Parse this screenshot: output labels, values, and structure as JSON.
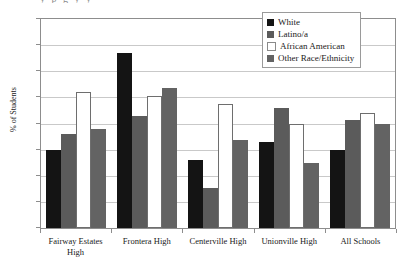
{
  "chart_data": {
    "type": "bar",
    "title": "",
    "xlabel": "",
    "ylabel": "% of Students",
    "ylim": [
      0,
      80
    ],
    "yticks": [
      0,
      10,
      20,
      30,
      40,
      50,
      60,
      70,
      80
    ],
    "grid": true,
    "legend_position": "top-right",
    "categories": [
      "Fairway Estates High",
      "Frontera High",
      "Centerville High",
      "Unionville High",
      "All Schools"
    ],
    "category_lines": [
      [
        "Fairway Estates",
        "High"
      ],
      [
        "Frontera High"
      ],
      [
        "Centerville High"
      ],
      [
        "Unionville High"
      ],
      [
        "All Schools"
      ]
    ],
    "series": [
      {
        "name": "White",
        "color": "#141414",
        "values": [
          30,
          67,
          26,
          33,
          30
        ]
      },
      {
        "name": "Latino/a",
        "color": "#5b5b5b",
        "values": [
          36,
          43,
          15.5,
          46,
          41.5
        ]
      },
      {
        "name": "African American",
        "color": "#ffffff",
        "values": [
          52,
          50.5,
          47.5,
          40,
          44
        ]
      },
      {
        "name": "Other Race/Ethnicity",
        "color": "#636363",
        "values": [
          38,
          53.5,
          33.5,
          25,
          40
        ]
      }
    ]
  },
  "legend": {
    "items": [
      {
        "label": "White"
      },
      {
        "label": "Latino/a"
      },
      {
        "label": "African American"
      },
      {
        "label": "Other Race/Ethnicity"
      }
    ]
  },
  "title_remnant": "y             p             g             y             y"
}
